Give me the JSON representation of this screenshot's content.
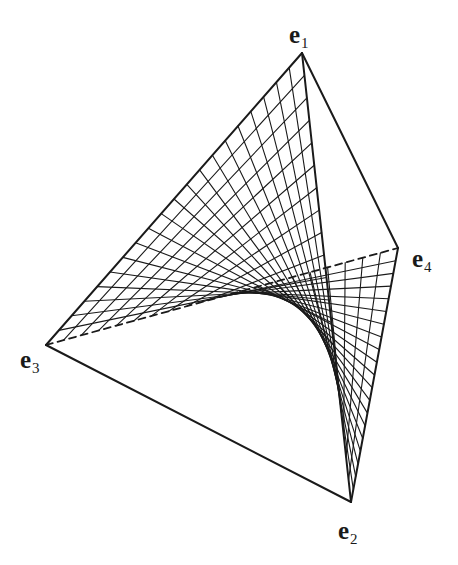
{
  "figure": {
    "colors": {
      "stroke": "#1a1a1a",
      "background": "#ffffff"
    },
    "vertices": {
      "e1": {
        "x": 302,
        "y": 53
      },
      "e2": {
        "x": 351,
        "y": 502
      },
      "e3": {
        "x": 46,
        "y": 345
      },
      "e4": {
        "x": 398,
        "y": 248
      }
    },
    "edges": [
      {
        "from": "e1",
        "to": "e3",
        "style": "solid"
      },
      {
        "from": "e1",
        "to": "e2",
        "style": "solid"
      },
      {
        "from": "e1",
        "to": "e4",
        "style": "solid"
      },
      {
        "from": "e3",
        "to": "e2",
        "style": "solid"
      },
      {
        "from": "e4",
        "to": "e2",
        "style": "solid"
      },
      {
        "from": "e3",
        "to": "e4",
        "style": "dashed"
      }
    ],
    "surface": {
      "corners": [
        "e1",
        "e3",
        "e4",
        "e2"
      ],
      "divisions": 20
    },
    "labels": [
      {
        "id": "e1",
        "base": "e",
        "sub": "1",
        "x": 289,
        "y": 22
      },
      {
        "id": "e2",
        "base": "e",
        "sub": "2",
        "x": 338,
        "y": 518
      },
      {
        "id": "e3",
        "base": "e",
        "sub": "3",
        "x": 20,
        "y": 347
      },
      {
        "id": "e4",
        "base": "e",
        "sub": "4",
        "x": 412,
        "y": 246
      }
    ]
  }
}
